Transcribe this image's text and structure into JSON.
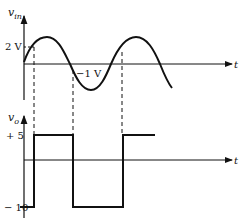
{
  "diagram": {
    "top_plot": {
      "y_axis_label": "v",
      "y_axis_subscript": "in",
      "x_axis_label": "t",
      "level_high_label": "2 V",
      "level_low_label": "−1 V",
      "signal": "sine wave input"
    },
    "bottom_plot": {
      "y_axis_label": "v",
      "y_axis_subscript": "o",
      "x_axis_label": "t",
      "level_high_label": "+ 5",
      "level_low_label": "− 10",
      "signal": "square wave output"
    },
    "colors": {
      "ink": "#111111",
      "background": "#ffffff"
    }
  }
}
